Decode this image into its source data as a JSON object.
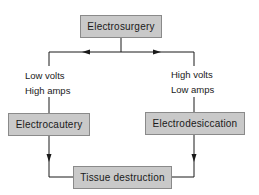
{
  "diagram": {
    "top_node": {
      "label": "Electrosurgery"
    },
    "left_branch": {
      "line1": "Low volts",
      "line2": "High amps"
    },
    "right_branch": {
      "line1": "High volts",
      "line2": "Low amps"
    },
    "left_node": {
      "label": "Electrocautery"
    },
    "right_node": {
      "label": "Electrodesiccation"
    },
    "bottom_node": {
      "label": "Tissue destruction"
    },
    "colors": {
      "box_fill": "#c9c9c9",
      "box_border": "#8a8a8a",
      "line": "#1a1a1a"
    }
  }
}
